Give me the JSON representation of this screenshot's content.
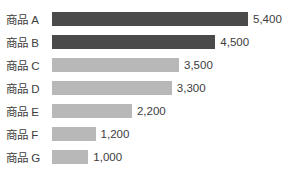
{
  "chart_data": {
    "type": "bar",
    "orientation": "horizontal",
    "title": "",
    "xlabel": "",
    "ylabel": "",
    "grid": false,
    "legend": false,
    "axis_visible": false,
    "xlim": [
      0,
      5400
    ],
    "categories": [
      "商品 A",
      "商品 B",
      "商品 C",
      "商品 D",
      "商品 E",
      "商品 F",
      "商品 G"
    ],
    "values": [
      5400,
      4500,
      3500,
      3300,
      2200,
      1200,
      1000
    ],
    "value_labels": [
      "5,400",
      "4,500",
      "3,500",
      "3,300",
      "2,200",
      "1,200",
      "1,000"
    ],
    "colors": [
      "#4a4a4a",
      "#4a4a4a",
      "#b8b8b8",
      "#b8b8b8",
      "#b8b8b8",
      "#b8b8b8",
      "#b8b8b8"
    ],
    "highlight_color": "#4a4a4a",
    "base_color": "#b8b8b8",
    "text_color": "#3c3c3c",
    "background_color": "#ffffff",
    "rows": [
      {
        "category": "商品 A",
        "value": 5400,
        "value_label": "5,400",
        "highlighted": true
      },
      {
        "category": "商品 B",
        "value": 4500,
        "value_label": "4,500",
        "highlighted": true
      },
      {
        "category": "商品 C",
        "value": 3500,
        "value_label": "3,500",
        "highlighted": false
      },
      {
        "category": "商品 D",
        "value": 3300,
        "value_label": "3,300",
        "highlighted": false
      },
      {
        "category": "商品 E",
        "value": 2200,
        "value_label": "2,200",
        "highlighted": false
      },
      {
        "category": "商品 F",
        "value": 1200,
        "value_label": "1,200",
        "highlighted": false
      },
      {
        "category": "商品 G",
        "value": 1000,
        "value_label": "1,000",
        "highlighted": false
      }
    ]
  }
}
